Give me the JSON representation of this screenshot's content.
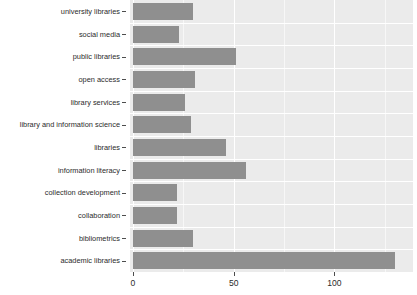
{
  "chart_data": {
    "type": "bar",
    "orientation": "horizontal",
    "title": "",
    "subtitle": "",
    "xlabel": "",
    "ylabel": "",
    "categories": [
      "university libraries",
      "social media",
      "public libraries",
      "open access",
      "library services",
      "library and information science",
      "libraries",
      "information literacy",
      "collection development",
      "collaboration",
      "bibliometrics",
      "academic libraries"
    ],
    "values": [
      30,
      23,
      51,
      31,
      26,
      29,
      46,
      56,
      22,
      22,
      30,
      130
    ],
    "xticks": [
      0,
      50,
      100
    ],
    "xtick_labels": [
      "0",
      "50",
      "100"
    ],
    "xlim": [
      0,
      137
    ],
    "ylim": [
      0,
      12
    ],
    "grid": true,
    "grid_minor": true,
    "legend": "none",
    "bar_color": "#8f8f8f",
    "panel_color": "#ebebeb",
    "grid_color": "#ffffff",
    "text_color": "#2b2b2b"
  }
}
